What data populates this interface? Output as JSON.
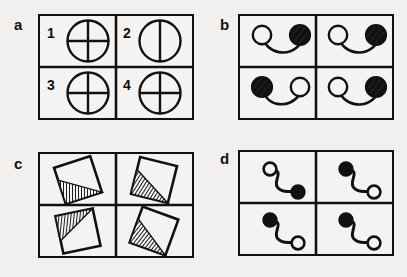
{
  "figure": {
    "background_color": "#f1f0ee",
    "ink_color": "#111111",
    "paper_color": "#f4f3f1",
    "panels": [
      {
        "id": "a",
        "label": "a",
        "item_type": "circle-with-diameter-lines",
        "numbered": true,
        "cells": [
          {
            "number": "1",
            "variant": "cross",
            "description": "circle with vertical and horizontal diameter lines"
          },
          {
            "number": "2",
            "variant": "vertical-only",
            "description": "circle with vertical diameter line only"
          },
          {
            "number": "3",
            "variant": "cross",
            "description": "circle with vertical and horizontal diameter lines"
          },
          {
            "number": "4",
            "variant": "cross",
            "description": "circle with vertical and horizontal diameter lines"
          }
        ],
        "odd_one_out": "2"
      },
      {
        "id": "b",
        "label": "b",
        "item_type": "two-discs-joined-by-hanging-curve",
        "numbered": false,
        "cells": [
          {
            "number": "1",
            "variant": "white-left-black-right",
            "description": "open circle on the left joined by a sagging line to a filled circle on the right"
          },
          {
            "number": "2",
            "variant": "white-left-black-right",
            "description": "open circle on the left joined by a sagging line to a filled circle on the right"
          },
          {
            "number": "3",
            "variant": "black-left-white-right",
            "description": "filled circle on the left joined by a sagging line to an open circle on the right"
          },
          {
            "number": "4",
            "variant": "white-left-black-right",
            "description": "open circle on the left joined by a sagging line to a filled circle on the right"
          }
        ],
        "odd_one_out": "3"
      },
      {
        "id": "c",
        "label": "c",
        "item_type": "tilted-square-with-hatched-triangle",
        "numbered": false,
        "cells": [
          {
            "number": "1",
            "variant": "hatch-bottom",
            "rotation": -18,
            "description": "tilted square with fan-hatched triangle occupying the lower half"
          },
          {
            "number": "2",
            "variant": "hatch-bottom",
            "rotation": 14,
            "description": "tilted square with fan-hatched triangle occupying the lower half"
          },
          {
            "number": "3",
            "variant": "hatch-top",
            "rotation": -12,
            "description": "tilted square with fan-hatched triangle occupying the upper half"
          },
          {
            "number": "4",
            "variant": "hatch-bottom",
            "rotation": 20,
            "description": "tilted square with fan-hatched triangle occupying the lower half"
          }
        ],
        "odd_one_out": "3"
      },
      {
        "id": "d",
        "label": "d",
        "item_type": "s-curve-with-discs-at-both-ends",
        "numbered": false,
        "cells": [
          {
            "number": "1",
            "variant": "white-top-black-bottom",
            "description": "S-shaped curve with open circle at upper left and filled circle at lower right"
          },
          {
            "number": "2",
            "variant": "black-top-white-bottom",
            "description": "S-shaped curve with filled circle at upper left and open circle at lower right"
          },
          {
            "number": "3",
            "variant": "black-top-white-bottom",
            "description": "S-shaped curve with filled circle at upper left and open circle at lower right"
          },
          {
            "number": "4",
            "variant": "black-top-white-bottom",
            "description": "S-shaped curve with filled circle at upper left and open circle at lower right"
          }
        ],
        "odd_one_out": "1"
      }
    ]
  }
}
